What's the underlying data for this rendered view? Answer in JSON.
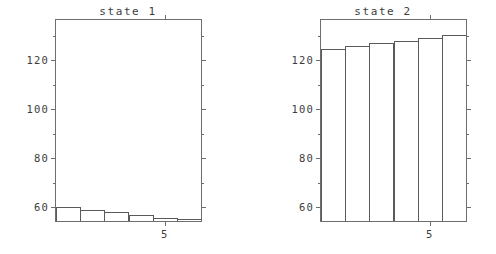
{
  "figure": {
    "background": "#ffffff",
    "axis_color": "#6e6e6e",
    "bar_edge_color": "#5a5a5a",
    "text_color": "#3d3d3d"
  },
  "panels": [
    {
      "key": "state1",
      "title": "state 1",
      "y_ticks": [
        "120",
        "100",
        "80",
        "60"
      ],
      "x_ticks": [
        "5"
      ]
    },
    {
      "key": "state2",
      "title": "state 2",
      "y_ticks": [
        "120",
        "100",
        "80",
        "60"
      ],
      "x_ticks": [
        "5"
      ]
    }
  ],
  "chart_data": [
    {
      "type": "bar",
      "title": "state 1",
      "xlabel": "",
      "ylabel": "",
      "categories": [
        "1",
        "2",
        "3",
        "4",
        "5",
        "6"
      ],
      "x": [
        1,
        2,
        3,
        4,
        5,
        6
      ],
      "values": [
        60.2,
        59.0,
        58.0,
        56.8,
        55.6,
        55.0
      ],
      "ylim": [
        54.3,
        136.5
      ],
      "xlim": [
        0.5,
        6.5
      ],
      "y_tick_values": [
        120,
        100,
        80,
        60
      ],
      "y_tick_labels": [
        "120",
        "100",
        "80",
        "60"
      ],
      "x_tick_values": [
        5
      ],
      "x_tick_labels": [
        "5"
      ],
      "grid": false,
      "legend": null,
      "bar_fill": "none",
      "bar_edge": "#5a5a5a"
    },
    {
      "type": "bar",
      "title": "state 2",
      "xlabel": "",
      "ylabel": "",
      "categories": [
        "1",
        "2",
        "3",
        "4",
        "5",
        "6"
      ],
      "x": [
        1,
        2,
        3,
        4,
        5,
        6
      ],
      "values": [
        124.8,
        126.0,
        127.0,
        127.8,
        129.2,
        130.4
      ],
      "ylim": [
        54.3,
        136.5
      ],
      "xlim": [
        0.5,
        6.5
      ],
      "y_tick_values": [
        120,
        100,
        80,
        60
      ],
      "y_tick_labels": [
        "120",
        "100",
        "80",
        "60"
      ],
      "x_tick_values": [
        5
      ],
      "x_tick_labels": [
        "5"
      ],
      "grid": false,
      "legend": null,
      "bar_fill": "none",
      "bar_edge": "#5a5a5a"
    }
  ]
}
